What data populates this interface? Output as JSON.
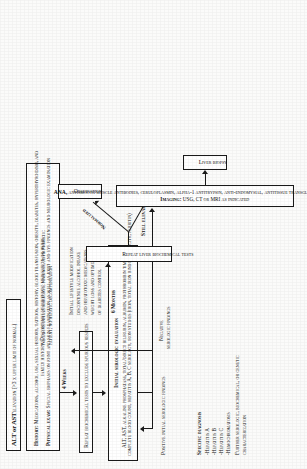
{
  "diagram": {
    "type": "clinical-algorithm-flowchart",
    "orientation_note": "rotated-90-ccw",
    "nodes": {
      "top": {
        "title": "ALT or AST",
        "title_rest": "elevation (>3 x upper limit of normal)"
      },
      "history": {
        "line1_label": "History:",
        "line1": "Medications, alcohol use, sexual history, tattoos, history, blood transfusion, obesity, diabetes, hyperthyroidism, and",
        "line2": "family history. Discontinue hepatotoxic medication or herbs",
        "line3_label": "Physical exam:",
        "line3": "Special emphasis on joint and skin examination as well as joint and eye findings and neurologic examination"
      },
      "repeat_biochem": {
        "label": "Repeat biochemical tests to exclude spurious results"
      },
      "serologic": {
        "title": "Initial serologic evaluation",
        "line1": "ALT, AST, alkaline phosphatase, total/direct bilirubin, albumin, prothrombin time,",
        "line2": "complete blood count, hepatitis A, B, C serology, iron studies (iron, total iron binding capacity, ferritin)"
      },
      "positive_findings": {
        "label": "Positive initial serologic findings"
      },
      "specific_dx": {
        "title": "Specific diagnosis",
        "items": [
          "-Hepatitis A",
          "-Hepatitis B",
          "-Hepatitis C",
          "-Hemochromatosis"
        ],
        "footer": "Further serologic, biochemical, or genetic characterization"
      },
      "negative_serologic": {
        "line1": "Negative",
        "line2": "serologic findings"
      },
      "negative_initial": {
        "line1": "Negative initial serologic findings, asymptomatic",
        "line2": "patient, no hepatic decompensation"
      },
      "lifestyle": {
        "line1": "Initial lifestyle modification",
        "line2": "discontinue alcohol intake",
        "line3": "and hepatotoxic medications,",
        "line4": "weight loss and optimization",
        "line5": "of diabetes control"
      },
      "repeat_liver": {
        "label": "Repeat liver biochemical tests"
      },
      "observation": {
        "label": "Observation"
      },
      "further_workup": {
        "line1": "ANA, antismooth muscle antibodies, ceruloplasmin, alpha-1 antitrypsin, anti-endomysial, antitissue transglutaminase antibodies",
        "line2_label": "Imaging:",
        "line2": "USG, CT or MRI as indicated"
      },
      "liver_biopsy": {
        "label": "Liver biopsy"
      }
    },
    "edge_labels": {
      "four_weeks": "4 Weeks",
      "six_months": "6 Months",
      "normalized": "Normalized",
      "still_elevated": "Still elevated"
    },
    "colors": {
      "ink": "#111111",
      "border": "#1a1a1a",
      "box_fill": "#ffffff",
      "page_bg": "#fbfbfa"
    }
  }
}
